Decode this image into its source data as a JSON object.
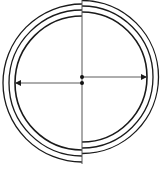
{
  "diagram": {
    "title": "",
    "colors": {
      "stroke": "#1a1a1a",
      "background": "#ffffff"
    },
    "divider_x": 82,
    "left_half": {
      "center": [
        82,
        83
      ],
      "radii": [
        67,
        73,
        79
      ],
      "arrow_to_x": 16
    },
    "right_half": {
      "center": [
        82,
        77
      ],
      "radii": [
        65,
        71,
        77
      ],
      "arrow_to_x": 147
    },
    "labels": []
  }
}
